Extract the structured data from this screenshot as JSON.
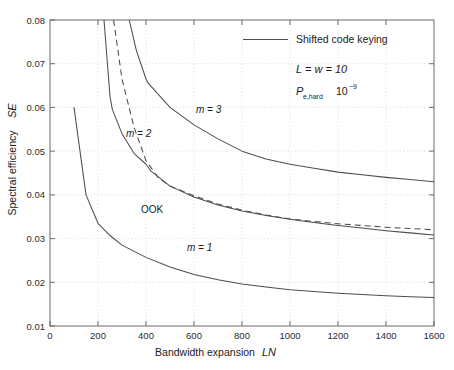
{
  "chart_data": {
    "type": "line",
    "title": "",
    "xlabel": "Bandwidth expansion   LN",
    "xlabel_text": "Bandwidth expansion",
    "xlabel_symbol": "LN",
    "ylabel": "Spectral efficiency   SE",
    "ylabel_text": "Spectral efficiency",
    "ylabel_symbol": "SE",
    "xlim": [
      0,
      1600
    ],
    "ylim": [
      0.01,
      0.08
    ],
    "xticks": [
      0,
      200,
      400,
      600,
      800,
      1000,
      1200,
      1400,
      1600
    ],
    "xtick_labels": [
      "0",
      "200",
      "400",
      "600",
      "800",
      "1000",
      "1200",
      "1400",
      "1600"
    ],
    "yticks": [
      0.01,
      0.02,
      0.03,
      0.04,
      0.05,
      0.06,
      0.07,
      0.08
    ],
    "ytick_labels": [
      "0.01",
      "0.02",
      "0.03",
      "0.04",
      "0.05",
      "0.06",
      "0.07",
      "0.08"
    ],
    "grid": true,
    "grid_style": "dotted",
    "legend_position": "upper-right-inside",
    "legend": [
      {
        "label": "Shifted code keying",
        "style": "solid"
      }
    ],
    "annotations": [
      {
        "name": "params-L-w",
        "text": "L = w = 10"
      },
      {
        "name": "params-pe",
        "text_symbol": "P",
        "text_sub": "e,hard",
        "text_value": "10",
        "text_exp": "-9"
      },
      {
        "name": "curve-label-m1",
        "text": "m = 1"
      },
      {
        "name": "curve-label-m2",
        "text": "m = 2"
      },
      {
        "name": "curve-label-m3",
        "text": "m = 3"
      },
      {
        "name": "curve-label-ook",
        "text": "OOK"
      }
    ],
    "series": [
      {
        "name": "m = 1",
        "style": "solid",
        "color": "#4d4d4d",
        "x": [
          100,
          150,
          200,
          250,
          300,
          400,
          500,
          600,
          700,
          800,
          900,
          1000,
          1100,
          1200,
          1300,
          1400,
          1500,
          1600
        ],
        "y": [
          0.06,
          0.04,
          0.0335,
          0.0307,
          0.0285,
          0.0257,
          0.0235,
          0.0218,
          0.0206,
          0.0196,
          0.0189,
          0.0183,
          0.0179,
          0.0175,
          0.0172,
          0.0169,
          0.0167,
          0.0165
        ]
      },
      {
        "name": "m = 2",
        "style": "solid",
        "color": "#4d4d4d",
        "x": [
          225,
          250,
          260,
          300,
          350,
          400,
          420,
          500,
          600,
          700,
          800,
          900,
          1000,
          1100,
          1200,
          1300,
          1400,
          1500,
          1600
        ],
        "y": [
          0.08,
          0.0625,
          0.0595,
          0.054,
          0.0495,
          0.047,
          0.0455,
          0.042,
          0.0395,
          0.0377,
          0.0363,
          0.0353,
          0.0344,
          0.0337,
          0.033,
          0.0324,
          0.0318,
          0.0313,
          0.0308
        ]
      },
      {
        "name": "m = 3",
        "style": "solid",
        "color": "#4d4d4d",
        "x": [
          330,
          360,
          400,
          410,
          500,
          600,
          700,
          800,
          900,
          1000,
          1100,
          1200,
          1300,
          1400,
          1500,
          1600
        ],
        "y": [
          0.08,
          0.073,
          0.0665,
          0.0655,
          0.06,
          0.056,
          0.0528,
          0.05,
          0.0482,
          0.047,
          0.0461,
          0.0452,
          0.0446,
          0.044,
          0.0435,
          0.043
        ]
      },
      {
        "name": "OOK",
        "style": "dashed",
        "color": "#4d4d4d",
        "x": [
          265,
          300,
          350,
          400,
          450,
          500,
          600,
          700,
          800,
          900,
          1000,
          1100,
          1200,
          1300,
          1400,
          1500,
          1600
        ],
        "y": [
          0.08,
          0.0665,
          0.0555,
          0.0478,
          0.044,
          0.042,
          0.0398,
          0.0379,
          0.0365,
          0.0354,
          0.0345,
          0.0339,
          0.0334,
          0.033,
          0.0326,
          0.0323,
          0.032
        ]
      }
    ]
  },
  "colors": {
    "background": "#ffffff",
    "axis": "#6a6a6a",
    "grid": "#cfcfcf",
    "curve": "#4d4d4d",
    "text": "#1a1a1a"
  }
}
